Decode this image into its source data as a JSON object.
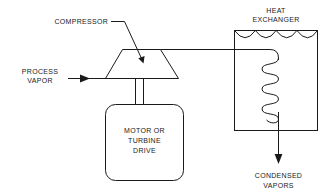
{
  "diagram": {
    "colors": {
      "stroke": "#1a1a1a",
      "background": "#ffffff"
    },
    "labels": {
      "compressor": "COMPRESSOR",
      "process_vapor_line1": "PROCESS",
      "process_vapor_line2": "VAPOR",
      "motor_line1": "MOTOR OR",
      "motor_line2": "TURBINE",
      "motor_line3": "DRIVE",
      "heat_exchanger_line1": "HEAT",
      "heat_exchanger_line2": "EXCHANGER",
      "condensed_line1": "CONDENSED",
      "condensed_line2": "VAPORS"
    },
    "components": [
      {
        "name": "compressor",
        "shape": "trapezoid",
        "label": "COMPRESSOR"
      },
      {
        "name": "motor-or-turbine-drive",
        "shape": "rounded-rectangle",
        "label": "MOTOR OR TURBINE DRIVE"
      },
      {
        "name": "heat-exchanger",
        "shape": "rectangle-with-scallops-and-coil",
        "label": "HEAT EXCHANGER"
      }
    ],
    "flows": [
      {
        "name": "process-vapor-inlet",
        "label": "PROCESS VAPOR",
        "direction": "right"
      },
      {
        "name": "compressor-discharge-line",
        "label": "",
        "direction": "right"
      },
      {
        "name": "condensed-vapors-outlet",
        "label": "CONDENSED VAPORS",
        "direction": "down"
      }
    ]
  }
}
